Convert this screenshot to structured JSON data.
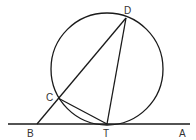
{
  "diagram": {
    "points": {
      "D": {
        "label": "D",
        "x": 126,
        "y": 18,
        "lx": 126,
        "ly": 14
      },
      "C": {
        "label": "C",
        "x": 58,
        "y": 98,
        "lx": 46,
        "ly": 101
      },
      "T": {
        "label": "T",
        "x": 107,
        "y": 124,
        "lx": 103,
        "ly": 136
      },
      "B": {
        "label": "B",
        "x": 37,
        "y": 124,
        "lx": 27,
        "ly": 136
      },
      "A": {
        "label": "A",
        "x": 190,
        "y": 124,
        "lx": 179,
        "ly": 136
      }
    },
    "circle": {
      "cx": 107,
      "cy": 69,
      "r": 56
    },
    "segments": [
      [
        "B",
        "D"
      ],
      [
        "D",
        "T"
      ],
      [
        "C",
        "T"
      ]
    ],
    "tangent_line": {
      "x1": 8,
      "x2": 190,
      "y": 124
    },
    "stroke_color": "#1a1a1a"
  }
}
